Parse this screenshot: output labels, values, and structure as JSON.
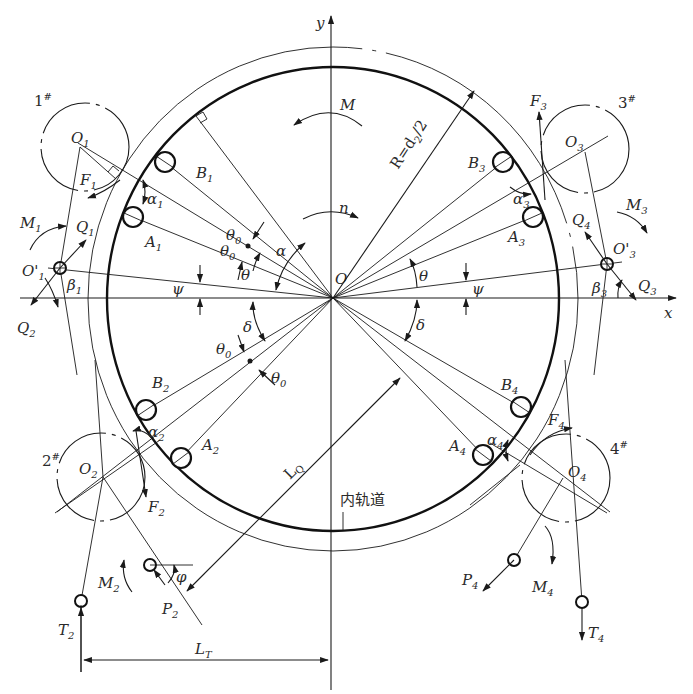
{
  "diagram": {
    "axes": {
      "x_label": "x",
      "y_label": "y",
      "origin_label": "O"
    },
    "races": {
      "inner_race_label": "内轨道",
      "radius_label": "R=d",
      "radius_sub": "2",
      "radius_suffix": "/2"
    },
    "moments": {
      "M": "M",
      "n": "n",
      "M1": {
        "base": "M",
        "sub": "1"
      },
      "M2": {
        "base": "M",
        "sub": "2"
      },
      "M3": {
        "base": "M",
        "sub": "3"
      },
      "M4": {
        "base": "M",
        "sub": "4"
      }
    },
    "rollers": [
      {
        "id": "1#",
        "num": "1",
        "mark": "#",
        "center": "O",
        "center_sub": "1",
        "pivot": "O'",
        "pivot_sub": "1"
      },
      {
        "id": "2#",
        "num": "2",
        "mark": "#",
        "center": "O",
        "center_sub": "2"
      },
      {
        "id": "3#",
        "num": "3",
        "mark": "#",
        "center": "O",
        "center_sub": "3",
        "pivot": "O'",
        "pivot_sub": "3"
      },
      {
        "id": "4#",
        "num": "4",
        "mark": "#",
        "center": "O",
        "center_sub": "4"
      }
    ],
    "balls": {
      "A1": {
        "base": "A",
        "sub": "1"
      },
      "B1": {
        "base": "B",
        "sub": "1"
      },
      "A2": {
        "base": "A",
        "sub": "2"
      },
      "B2": {
        "base": "B",
        "sub": "2"
      },
      "A3": {
        "base": "A",
        "sub": "3"
      },
      "B3": {
        "base": "B",
        "sub": "3"
      },
      "A4": {
        "base": "A",
        "sub": "4"
      },
      "B4": {
        "base": "B",
        "sub": "4"
      }
    },
    "forces": {
      "F1": {
        "base": "F",
        "sub": "1"
      },
      "F2": {
        "base": "F",
        "sub": "2"
      },
      "F3": {
        "base": "F",
        "sub": "3"
      },
      "F4": {
        "base": "F",
        "sub": "4"
      },
      "Q1": {
        "base": "Q",
        "sub": "1"
      },
      "Q2": {
        "base": "Q",
        "sub": "2"
      },
      "Q3": {
        "base": "Q",
        "sub": "3"
      },
      "Q4": {
        "base": "Q",
        "sub": "4"
      },
      "P2": {
        "base": "P",
        "sub": "2"
      },
      "P4": {
        "base": "P",
        "sub": "4"
      },
      "T2": {
        "base": "T",
        "sub": "2"
      },
      "T4": {
        "base": "T",
        "sub": "4"
      }
    },
    "angles": {
      "alpha": "α",
      "alpha1": {
        "base": "α",
        "sub": "1"
      },
      "alpha2": {
        "base": "α",
        "sub": "2"
      },
      "alpha3": {
        "base": "α",
        "sub": "3"
      },
      "alpha4": {
        "base": "α",
        "sub": "4"
      },
      "beta1": {
        "base": "β",
        "sub": "1"
      },
      "beta3": {
        "base": "β",
        "sub": "3"
      },
      "theta": "θ",
      "theta0": {
        "base": "θ",
        "sub": "0"
      },
      "delta": "δ",
      "psi": "ψ",
      "phi": "φ"
    },
    "dimensions": {
      "LQ": {
        "base": "L",
        "sub": "Q"
      },
      "LT": {
        "base": "L",
        "sub": "T"
      }
    }
  }
}
